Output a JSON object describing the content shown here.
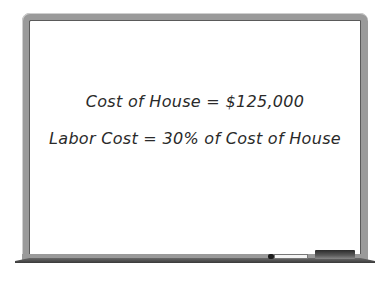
{
  "whiteboard": {
    "lines": [
      "Cost of House = $125,000",
      "Labor Cost = 30% of Cost of House"
    ]
  },
  "colors": {
    "frame": "#9a9a9a",
    "board": "#ffffff",
    "text": "#2a2a2a"
  }
}
